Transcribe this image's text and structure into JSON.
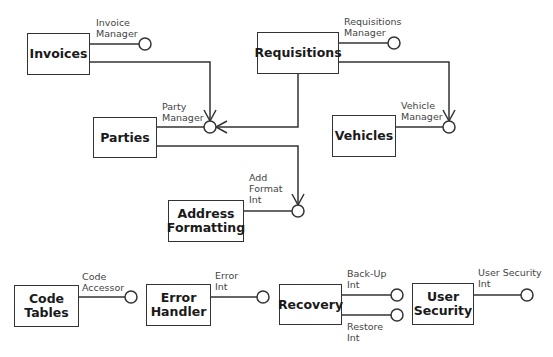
{
  "components": {
    "invoices": {
      "label": "Invoices"
    },
    "requisitions": {
      "label": "Requisitions"
    },
    "parties": {
      "label": "Parties"
    },
    "vehicles": {
      "label": "Vehicles"
    },
    "address_formatting": {
      "label": "Address\nFormatting"
    },
    "code_tables": {
      "label": "Code\nTables"
    },
    "error_handler": {
      "label": "Error\nHandler"
    },
    "recovery": {
      "label": "Recovery"
    },
    "user_security": {
      "label": "User\nSecurity"
    }
  },
  "interfaces": {
    "invoice_manager": "Invoice\nManager",
    "requisitions_manager": "Requisitions\nManager",
    "party_manager": "Party\nManager",
    "vehicle_manager": "Vehicle\nManager",
    "add_format_int": "Add\nFormat\nInt",
    "code_accessor": "Code\nAccessor",
    "error_int": "Error\nInt",
    "back_up_int": "Back-Up\nInt",
    "restore_int": "Restore\nInt",
    "user_security_int": "User Security\nInt"
  },
  "dependencies": [
    {
      "from": "Invoices",
      "to": "Party Manager"
    },
    {
      "from": "Requisitions",
      "to": "Party Manager"
    },
    {
      "from": "Requisitions",
      "to": "Vehicle Manager"
    },
    {
      "from": "Parties",
      "to": "Add Format Int"
    }
  ],
  "colors": {
    "line": "#333333",
    "text": "#1a1a1a",
    "label": "#444444"
  }
}
